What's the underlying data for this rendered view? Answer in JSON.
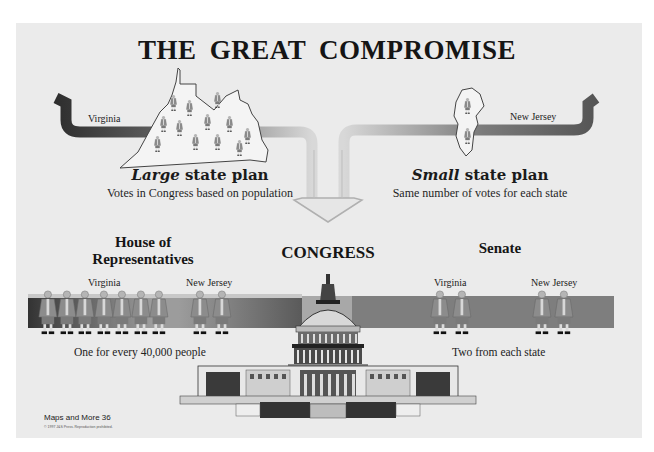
{
  "title": "THE  GREAT COMPROMISE",
  "large_plan": {
    "state_label": "Virginia",
    "title_em": "Large",
    "title_rest": " state plan",
    "subtitle": "Votes in Congress based on population",
    "delegate_count": 12
  },
  "small_plan": {
    "state_label": "New Jersey",
    "title_em": "Small",
    "title_rest": " state plan",
    "subtitle": "Same number of votes for each state",
    "delegate_count": 2
  },
  "congress": {
    "label": "CONGRESS",
    "icon": "capitol-building-icon"
  },
  "house": {
    "title_line1": "House of",
    "title_line2": "Representatives",
    "state_a": "Virginia",
    "state_b": "New Jersey",
    "state_a_count": 7,
    "state_b_count": 2,
    "caption": "One for every 40,000 people"
  },
  "senate": {
    "title": "Senate",
    "state_a": "Virginia",
    "state_b": "New Jersey",
    "state_a_count": 2,
    "state_b_count": 2,
    "caption": "Two from each state"
  },
  "footer": {
    "source": "Maps and More 36",
    "copyright": "© 1997 J&S Press. Reproduction prohibited."
  },
  "colors": {
    "paper": "#ebebeb",
    "band_dark": "#3c3c3c",
    "band_light": "#9a9a9a",
    "figure": "#8a8a8a",
    "text": "#1a1a1a"
  }
}
